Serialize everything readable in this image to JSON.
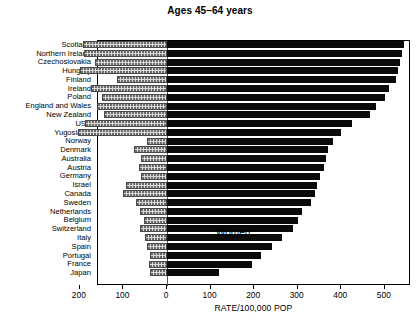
{
  "chart_data": {
    "type": "bar",
    "orientation": "horizontal",
    "subtype": "population-pyramid",
    "title": "Ages 45–64 years",
    "xlabel": "RATE/100,000 POP",
    "ylabel": "",
    "grid": false,
    "legend_position": "in-plot",
    "annotations": [
      "Women",
      "Men"
    ],
    "xlim": [
      -200,
      560
    ],
    "xticks": [
      -200,
      -100,
      0,
      100,
      200,
      300,
      400,
      500
    ],
    "xtick_labels": [
      "200",
      "100",
      "0",
      "100",
      "200",
      "300",
      "400",
      "500"
    ],
    "categories": [
      "Scotland",
      "Northern Ireland",
      "Czechoslovakia",
      "Hungary",
      "Finland",
      "Ireland",
      "Poland",
      "England and Wales",
      "New Zealand",
      "USA",
      "Yugoslavia",
      "Norway",
      "Denmark",
      "Australia",
      "Austria",
      "Germany",
      "Israel",
      "Canada",
      "Sweden",
      "Netherlands",
      "Belgium",
      "Switzerland",
      "Italy",
      "Spain",
      "Portugal",
      "France",
      "Japan"
    ],
    "series": [
      {
        "name": "Men",
        "color": "#0a0a0a",
        "values": [
          545,
          540,
          535,
          530,
          525,
          510,
          500,
          480,
          465,
          425,
          400,
          380,
          370,
          365,
          360,
          350,
          345,
          340,
          330,
          310,
          300,
          290,
          265,
          240,
          215,
          195,
          120
        ]
      },
      {
        "name": "Women",
        "color": "#d8d8d8",
        "values": [
          192,
          190,
          165,
          200,
          115,
          175,
          150,
          160,
          145,
          188,
          205,
          45,
          75,
          60,
          65,
          60,
          95,
          100,
          72,
          62,
          52,
          62,
          50,
          45,
          40,
          42,
          40
        ]
      }
    ]
  },
  "chart": {
    "title": "Ages 45–64 years",
    "xlabel": "RATE/100,000 POP",
    "women_label": "Women",
    "men_label": "Men"
  }
}
